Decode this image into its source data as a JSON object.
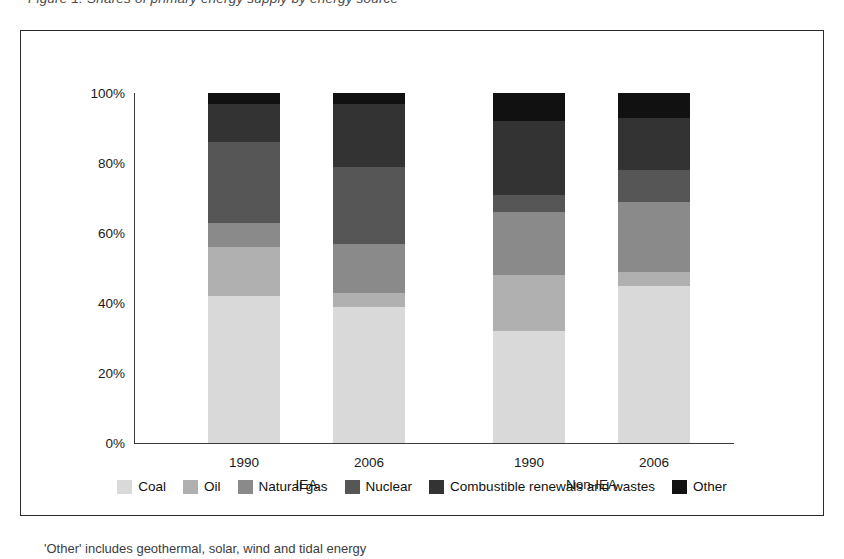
{
  "top_caption": "Figure 1: Shares of primary energy supply by energy source",
  "footnote": "'Other' includes geothermal, solar, wind and tidal energy",
  "chart_data": {
    "type": "bar",
    "subtype": "stacked-100-percent",
    "title": "",
    "xlabel": "",
    "ylabel": "",
    "ylim": [
      0,
      100
    ],
    "yticks": [
      "0%",
      "20%",
      "40%",
      "60%",
      "80%",
      "100%"
    ],
    "ytick_values": [
      0,
      20,
      40,
      60,
      80,
      100
    ],
    "grid": false,
    "legend_position": "bottom",
    "categories": [
      "1990",
      "2006",
      "1990",
      "2006"
    ],
    "groups": [
      {
        "name": "IEA",
        "categories": [
          "1990",
          "2006"
        ]
      },
      {
        "name": "Non-IEA",
        "categories": [
          "1990",
          "2006"
        ]
      }
    ],
    "series": [
      {
        "name": "Coal",
        "color": "#d9d9d9",
        "values": [
          42,
          39,
          32,
          45
        ]
      },
      {
        "name": "Oil",
        "color": "#b0b0b0",
        "values": [
          14,
          4,
          16,
          4
        ]
      },
      {
        "name": "Natural gas",
        "color": "#8a8a8a",
        "values": [
          7,
          14,
          18,
          20
        ]
      },
      {
        "name": "Nuclear",
        "color": "#565656",
        "values": [
          23,
          22,
          5,
          9
        ]
      },
      {
        "name": "Combustible renewals and wastes",
        "color": "#333333",
        "values": [
          11,
          18,
          21,
          15
        ]
      },
      {
        "name": "Other",
        "color": "#111111",
        "values": [
          3,
          3,
          8,
          7
        ]
      }
    ]
  }
}
